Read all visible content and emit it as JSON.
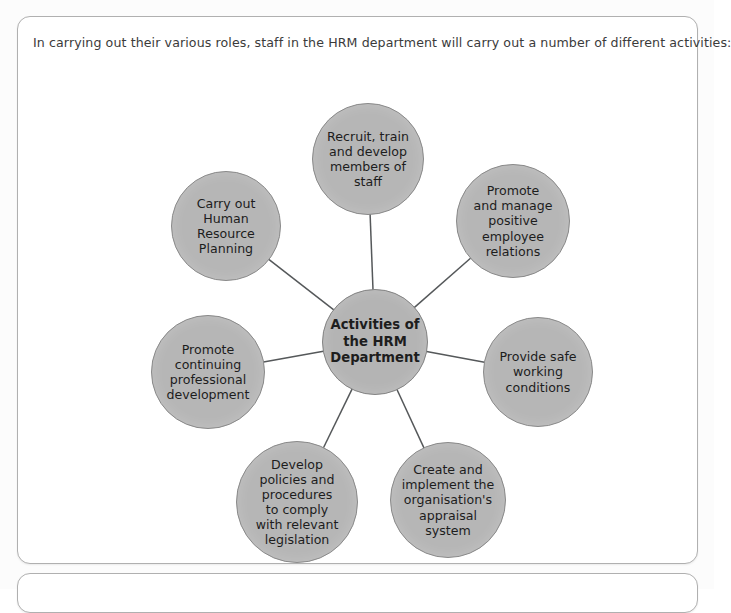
{
  "page": {
    "background_color": "#fcfcfc"
  },
  "panel_main": {
    "name": "hrm-activities-panel",
    "intro_text": "In carrying out their various roles, staff in the HRM department will carry out a number of different activities:",
    "border_color": "#b0b0b0",
    "background_color": "#ffffff"
  },
  "panel_secondary": {
    "name": "secondary-panel",
    "border_color": "#b0b0b0",
    "background_color": "#ffffff"
  },
  "chart_data": {
    "type": "diagram",
    "diagram_style": "hub-and-spoke",
    "title": "Activities of the HRM Department",
    "center": {
      "id": "center",
      "label": "Activities of\nthe HRM\nDepartment",
      "cx": 357,
      "cy": 325,
      "r": 53,
      "fill": "#b4b4b4",
      "stroke": "#838383",
      "bold": true
    },
    "nodes": [
      {
        "id": "recruit-train-develop",
        "label": "Recruit, train\nand develop\nmembers of\nstaff",
        "cx": 350,
        "cy": 142,
        "r": 56,
        "angle_deg": 90,
        "fill": "#b6b6b6",
        "stroke": "#8a8a8a"
      },
      {
        "id": "promote-manage-relations",
        "label": "Promote\nand manage\npositive employee\nrelations",
        "cx": 495,
        "cy": 204,
        "r": 57,
        "angle_deg": 45,
        "fill": "#b6b6b6",
        "stroke": "#8a8a8a"
      },
      {
        "id": "provide-safe-conditions",
        "label": "Provide safe\nworking\nconditions",
        "cx": 520,
        "cy": 355,
        "r": 55,
        "angle_deg": 0,
        "fill": "#b6b6b6",
        "stroke": "#8a8a8a"
      },
      {
        "id": "appraisal-system",
        "label": "Create and\nimplement the\norganisation's\nappraisal system",
        "cx": 430,
        "cy": 483,
        "r": 58,
        "angle_deg": -50,
        "fill": "#b6b6b6",
        "stroke": "#8a8a8a"
      },
      {
        "id": "develop-policies",
        "label": "Develop\npolicies and\nprocedures\nto comply\nwith relevant\nlegislation",
        "cx": 279,
        "cy": 485,
        "r": 61,
        "angle_deg": -125,
        "fill": "#b6b6b6",
        "stroke": "#8a8a8a"
      },
      {
        "id": "promote-cpd",
        "label": "Promote\ncontinuing\nprofessional\ndevelopment",
        "cx": 190,
        "cy": 355,
        "r": 57,
        "angle_deg": 180,
        "fill": "#b6b6b6",
        "stroke": "#8a8a8a"
      },
      {
        "id": "human-resource-planning",
        "label": "Carry out\nHuman\nResource\nPlanning",
        "cx": 208,
        "cy": 209,
        "r": 55,
        "angle_deg": 135,
        "fill": "#b6b6b6",
        "stroke": "#8a8a8a"
      }
    ],
    "connectors": {
      "stroke": "#55585a",
      "stroke_width": 1.5,
      "pairs": [
        [
          "center",
          "recruit-train-develop"
        ],
        [
          "center",
          "promote-manage-relations"
        ],
        [
          "center",
          "provide-safe-conditions"
        ],
        [
          "center",
          "appraisal-system"
        ],
        [
          "center",
          "develop-policies"
        ],
        [
          "center",
          "promote-cpd"
        ],
        [
          "center",
          "human-resource-planning"
        ]
      ]
    }
  }
}
